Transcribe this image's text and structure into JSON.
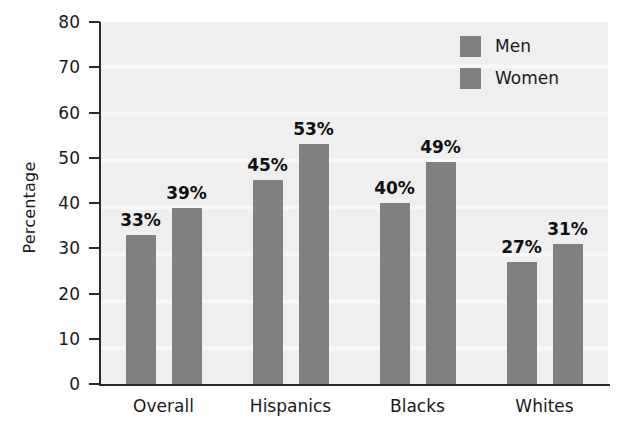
{
  "chart_data": {
    "type": "bar",
    "title": "",
    "subtitle": "",
    "xlabel": "",
    "ylabel": "Percentage",
    "categories": [
      "Overall",
      "Hispanics",
      "Blacks",
      "Whites"
    ],
    "series": [
      {
        "name": "Men",
        "values": [
          33,
          45,
          40,
          27
        ],
        "color": "#808080"
      },
      {
        "name": "Women",
        "values": [
          39,
          53,
          49,
          31
        ],
        "color": "#808080"
      }
    ],
    "data_labels": [
      [
        "33%",
        "45%",
        "40%",
        "27%"
      ],
      [
        "39%",
        "53%",
        "49%",
        "31%"
      ]
    ],
    "ylim": [
      0,
      80
    ],
    "ytick_step": 10,
    "ytick_labels": [
      "80",
      "70",
      "60",
      "50",
      "40",
      "30",
      "20",
      "10",
      "0"
    ],
    "ytick_values": [
      80,
      70,
      60,
      50,
      40,
      30,
      20,
      10,
      0
    ],
    "grid": "horizontal-faint",
    "legend_position": "top-right-inside",
    "legend_entries": [
      "Men",
      "Women"
    ],
    "plot_background": "#efefef",
    "axis_color": "#2b2b2b",
    "bar_color": "#808080"
  },
  "axis": {
    "y_title": "Percentage"
  },
  "legend": {
    "items": [
      {
        "label": "Men"
      },
      {
        "label": "Women"
      }
    ]
  }
}
